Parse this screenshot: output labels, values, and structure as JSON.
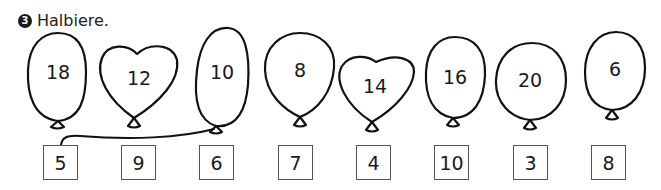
{
  "exercise": {
    "number": "3",
    "instruction": "Halbiere."
  },
  "balloons": [
    {
      "value": "18",
      "shape": "oval"
    },
    {
      "value": "12",
      "shape": "heart"
    },
    {
      "value": "10",
      "shape": "oval"
    },
    {
      "value": "8",
      "shape": "round"
    },
    {
      "value": "14",
      "shape": "heart"
    },
    {
      "value": "16",
      "shape": "oval"
    },
    {
      "value": "20",
      "shape": "round"
    },
    {
      "value": "6",
      "shape": "oval"
    }
  ],
  "answer_boxes": [
    "5",
    "9",
    "6",
    "7",
    "4",
    "10",
    "3",
    "8"
  ],
  "connections": [
    {
      "from_balloon": "10",
      "to_box": "5"
    }
  ]
}
